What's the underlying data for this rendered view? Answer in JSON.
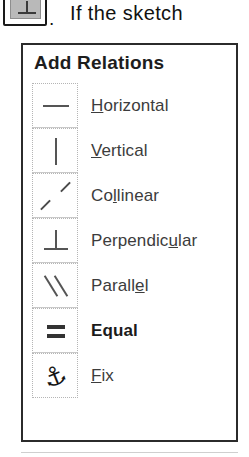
{
  "document_text": {
    "inline_icon": "perpendicular-toolbar-icon",
    "period": ".",
    "sentence": "If the sketch"
  },
  "panel": {
    "title": "Add Relations",
    "items": [
      {
        "icon": "horizontal-relation-icon",
        "label": "Horizontal",
        "accelerator": "H",
        "accel_index": 0,
        "bold": false
      },
      {
        "icon": "vertical-relation-icon",
        "label": "Vertical",
        "accelerator": "V",
        "accel_index": 0,
        "bold": false
      },
      {
        "icon": "collinear-relation-icon",
        "label": "Collinear",
        "accelerator": "l",
        "accel_index": 2,
        "bold": false
      },
      {
        "icon": "perpendicular-relation-icon",
        "label": "Perpendicular",
        "accelerator": "u",
        "accel_index": 9,
        "bold": false
      },
      {
        "icon": "parallel-relation-icon",
        "label": "Parallel",
        "accelerator": "e",
        "accel_index": 6,
        "bold": false
      },
      {
        "icon": "equal-relation-icon",
        "label": "Equal",
        "accelerator": "",
        "accel_index": -1,
        "bold": true
      },
      {
        "icon": "fix-anchor-icon",
        "label": "Fix",
        "accelerator": "F",
        "accel_index": 0,
        "bold": false
      }
    ]
  },
  "colors": {
    "panel_border": "#2b2b2b",
    "cell_border": "#b5b5b5",
    "glyph": "#555555",
    "text": "#3c3c3c",
    "title": "#1d1d1d",
    "button_face": "#b9b9b9"
  }
}
